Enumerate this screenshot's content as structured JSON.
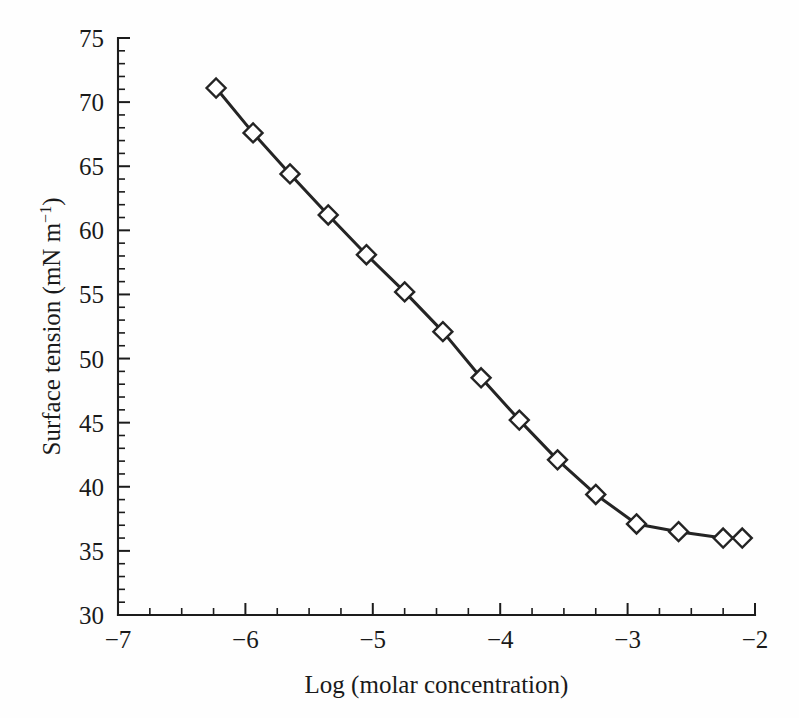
{
  "chart_data": {
    "type": "line",
    "title": "",
    "subtitle": "",
    "xlabel": "Log (molar concentration)",
    "ylabel": "Surface tension (mN m⁻¹)",
    "ylabel_main": "Surface tension (mN m",
    "ylabel_sup": "−1",
    "ylabel_tail": ")",
    "xlim": [
      -7,
      -2
    ],
    "ylim": [
      30,
      75
    ],
    "x_major_ticks": [
      -7,
      -6,
      -5,
      -4,
      -3,
      -2
    ],
    "x_tick_labels": [
      "−7",
      "−6",
      "−5",
      "−4",
      "−3",
      "−2"
    ],
    "x_minor_step": 0.25,
    "y_major_ticks": [
      30,
      35,
      40,
      45,
      50,
      55,
      60,
      65,
      70,
      75
    ],
    "y_tick_labels": [
      "30",
      "35",
      "40",
      "45",
      "50",
      "55",
      "60",
      "65",
      "70",
      "75"
    ],
    "y_minor_step": 1,
    "grid": false,
    "legend": null,
    "marker": "open-diamond",
    "line_color": "#242424",
    "marker_fill": "#ffffff",
    "marker_edge": "#242424",
    "background": "#fefefe",
    "series": [
      {
        "name": "surface tension",
        "x": [
          -6.23,
          -5.94,
          -5.65,
          -5.35,
          -5.05,
          -4.75,
          -4.45,
          -4.15,
          -3.85,
          -3.55,
          -3.25,
          -2.93,
          -2.6,
          -2.25,
          -2.1
        ],
        "values": [
          71.1,
          67.6,
          64.4,
          61.2,
          58.1,
          55.2,
          52.1,
          48.5,
          45.2,
          42.1,
          39.4,
          37.1,
          36.5,
          36.0,
          36.0
        ]
      }
    ],
    "points": [
      {
        "x": -6.23,
        "y": 71.1
      },
      {
        "x": -5.94,
        "y": 67.6
      },
      {
        "x": -5.65,
        "y": 64.4
      },
      {
        "x": -5.35,
        "y": 61.2
      },
      {
        "x": -5.05,
        "y": 58.1
      },
      {
        "x": -4.75,
        "y": 55.2
      },
      {
        "x": -4.45,
        "y": 52.1
      },
      {
        "x": -4.15,
        "y": 48.5
      },
      {
        "x": -3.85,
        "y": 45.2
      },
      {
        "x": -3.55,
        "y": 42.1
      },
      {
        "x": -3.25,
        "y": 39.4
      },
      {
        "x": -2.93,
        "y": 37.1
      },
      {
        "x": -2.6,
        "y": 36.5
      },
      {
        "x": -2.25,
        "y": 36.0
      },
      {
        "x": -2.1,
        "y": 36.0
      }
    ]
  }
}
